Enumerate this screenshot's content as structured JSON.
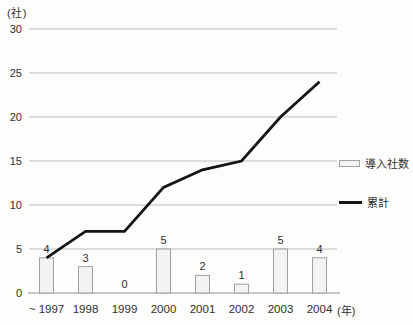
{
  "chart_data": {
    "type": "combo",
    "categories": [
      "~ 1997",
      "1998",
      "1999",
      "2000",
      "2001",
      "2002",
      "2003",
      "2004"
    ],
    "series": [
      {
        "name": "導入社数",
        "type": "bar",
        "values": [
          4,
          3,
          0,
          5,
          2,
          1,
          5,
          4
        ]
      },
      {
        "name": "累計",
        "type": "line",
        "values": [
          4,
          7,
          7,
          12,
          14,
          15,
          20,
          24
        ]
      }
    ],
    "bar_value_labels": [
      "4",
      "3",
      "0",
      "5",
      "2",
      "1",
      "5",
      "4"
    ],
    "title": "",
    "xlabel": "",
    "ylabel": "",
    "y_unit": "(社)",
    "x_unit": "(年)",
    "ylim": [
      0,
      30
    ],
    "yticks": [
      0,
      5,
      10,
      15,
      20,
      25,
      30
    ],
    "grid": "horizontal",
    "legend_position": "right-middle",
    "colors": {
      "bar_fill": "#f3f3f1",
      "bar_border": "#a0a0a0",
      "line": "#141414",
      "gridline": "#bcbcbc",
      "axis": "#8f8f8f",
      "text": "#2f2f2f"
    }
  }
}
